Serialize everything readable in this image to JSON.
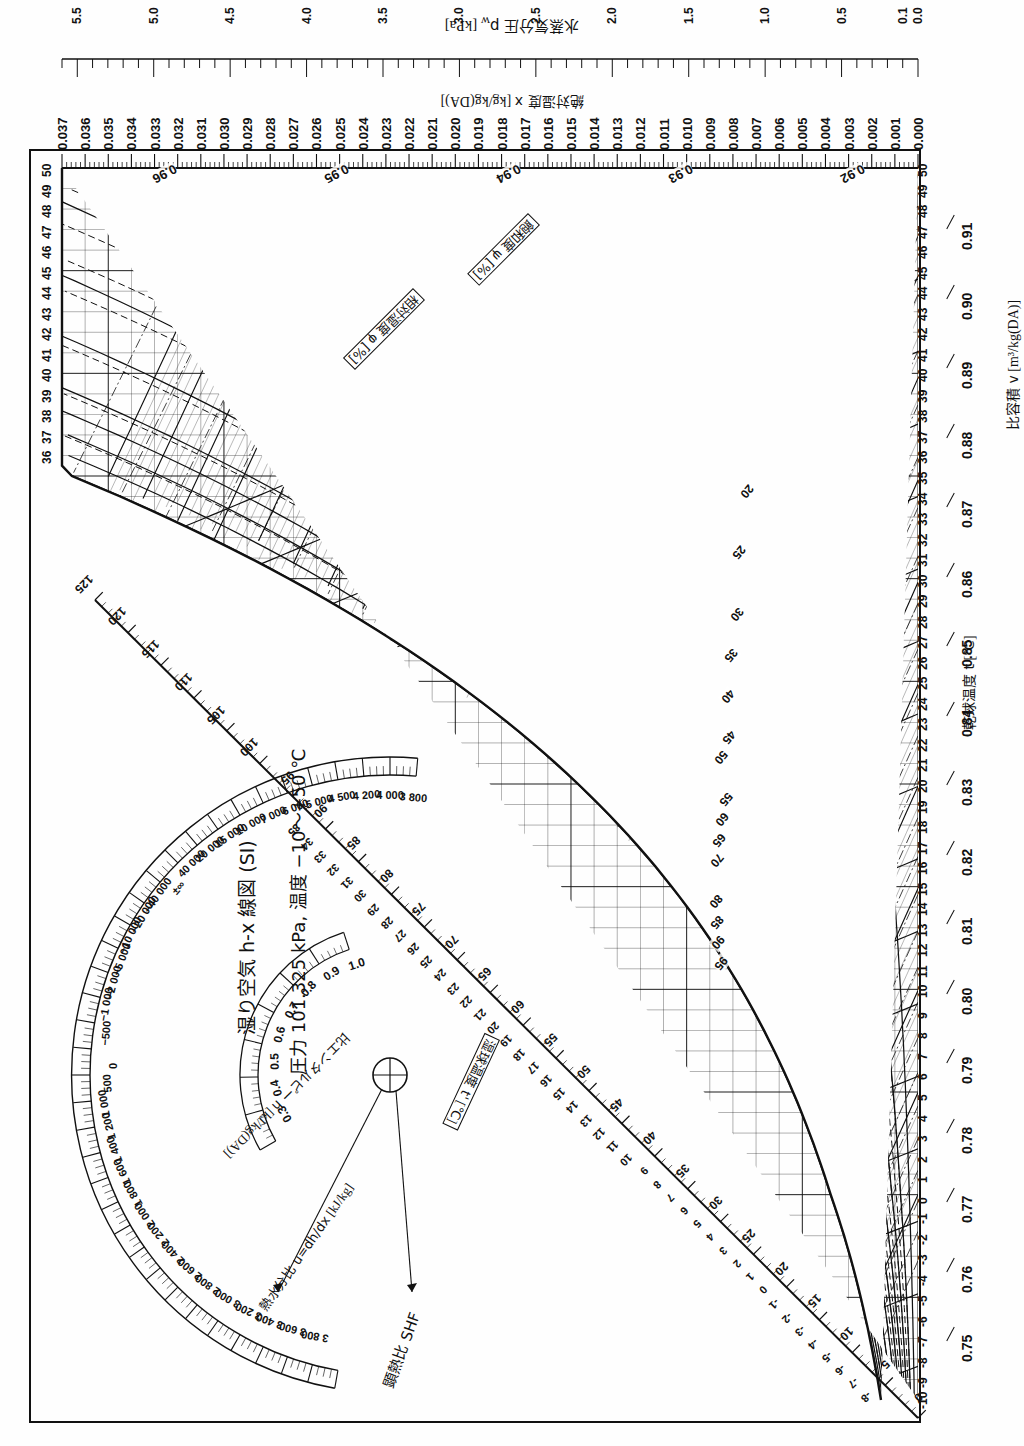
{
  "document": {
    "kind": "psychrometric-chart",
    "language": "ja",
    "title_line1": "湿り空気 h-x 線図 (SI)",
    "title_line2": "圧力 101.325 kPa,  温度 −10〜+50 ℃"
  },
  "axes": {
    "vapor_pressure": {
      "label": "水蒸気分圧 p",
      "label_sub": "w",
      "label_unit": "[kPa]",
      "ticks": [
        "5.5",
        "5.0",
        "4.5",
        "4.0",
        "3.5",
        "3.0",
        "2.5",
        "2.0",
        "1.5",
        "1.0",
        "0.5",
        "0.1",
        "0.0"
      ],
      "values": [
        5.5,
        5.0,
        4.5,
        4.0,
        3.5,
        3.0,
        2.5,
        2.0,
        1.5,
        1.0,
        0.5,
        0.1,
        0.0
      ],
      "minor_step": 0.1
    },
    "humidity_ratio": {
      "label": "絶対湿度 x",
      "label_unit": "[kg/kg(DA)]",
      "ticks": [
        "0.037",
        "0.036",
        "0.035",
        "0.034",
        "0.033",
        "0.032",
        "0.031",
        "0.030",
        "0.029",
        "0.028",
        "0.027",
        "0.026",
        "0.025",
        "0.024",
        "0.023",
        "0.022",
        "0.021",
        "0.020",
        "0.019",
        "0.018",
        "0.017",
        "0.016",
        "0.015",
        "0.014",
        "0.013",
        "0.012",
        "0.011",
        "0.010",
        "0.009",
        "0.008",
        "0.007",
        "0.006",
        "0.005",
        "0.004",
        "0.003",
        "0.002",
        "0.001",
        "0.000"
      ],
      "max": 0.037,
      "min": 0.0,
      "minor_step": 0.0002
    },
    "dry_bulb": {
      "label": "乾球温度 t",
      "label_unit": "[℃]",
      "min": -10,
      "max": 50,
      "ticks": [
        "-10",
        "-9",
        "-8",
        "-7",
        "-6",
        "-5",
        "-4",
        "-3",
        "-2",
        "-1",
        "0",
        "1",
        "2",
        "3",
        "4",
        "5",
        "6",
        "7",
        "8",
        "9",
        "10",
        "11",
        "12",
        "13",
        "14",
        "15",
        "16",
        "17",
        "18",
        "19",
        "20",
        "21",
        "22",
        "23",
        "24",
        "25",
        "26",
        "27",
        "28",
        "29",
        "30",
        "31",
        "32",
        "33",
        "34",
        "35",
        "36",
        "37",
        "38",
        "39",
        "40",
        "41",
        "42",
        "43",
        "44",
        "45",
        "46",
        "47",
        "48",
        "49",
        "50"
      ]
    },
    "specific_volume": {
      "label": "比容積 v",
      "label_unit": "[m³/kg(DA)]",
      "ticks": [
        "0.75",
        "0.76",
        "0.77",
        "0.78",
        "0.79",
        "0.80",
        "0.81",
        "0.82",
        "0.83",
        "0.84",
        "0.85",
        "0.86",
        "0.87",
        "0.88",
        "0.89",
        "0.90",
        "0.91"
      ],
      "values": [
        0.75,
        0.76,
        0.77,
        0.78,
        0.79,
        0.8,
        0.81,
        0.82,
        0.83,
        0.84,
        0.85,
        0.86,
        0.87,
        0.88,
        0.89,
        0.9,
        0.91
      ],
      "body_line_labels": [
        "0.92",
        "0.93",
        "0.94",
        "0.95",
        "0.96"
      ]
    },
    "enthalpy": {
      "label": "比エンタルピー h",
      "label_unit": "[kJ/kg(DA)]",
      "ticks": [
        "0",
        "5",
        "10",
        "15",
        "20",
        "25",
        "30",
        "35",
        "40",
        "45",
        "50",
        "55",
        "60",
        "65",
        "70",
        "75",
        "80",
        "85",
        "90",
        "95",
        "100",
        "105",
        "110",
        "115",
        "120",
        "125"
      ],
      "values": [
        0,
        5,
        10,
        15,
        20,
        25,
        30,
        35,
        40,
        45,
        50,
        55,
        60,
        65,
        70,
        75,
        80,
        85,
        90,
        95,
        100,
        105,
        110,
        115,
        120,
        125
      ],
      "minor_step": 1
    },
    "wet_bulb": {
      "label": "湿球温度 t'",
      "label_unit": "[℃]",
      "ticks": [
        "-8",
        "-7",
        "-6",
        "-5",
        "-4",
        "-3",
        "-2",
        "-1",
        "0",
        "1",
        "2",
        "3",
        "4",
        "5",
        "6",
        "7",
        "8",
        "9",
        "10",
        "11",
        "12",
        "13",
        "14",
        "15",
        "16",
        "17",
        "18",
        "19",
        "20",
        "21",
        "22",
        "23",
        "24",
        "25",
        "26",
        "27",
        "28",
        "29",
        "30",
        "31",
        "32",
        "33",
        "34",
        "35"
      ],
      "min": -8,
      "max": 35
    }
  },
  "curves": {
    "relative_humidity": {
      "label": "相対湿度 φ [%]",
      "symbol": "φ",
      "unit": "[%]",
      "values": [
        10,
        20,
        30,
        40,
        50,
        60,
        70,
        80,
        85,
        90,
        95,
        100
      ],
      "body_labels": [
        "20",
        "25",
        "30",
        "35",
        "40",
        "45",
        "50",
        "55",
        "60",
        "65",
        "70",
        "80",
        "85",
        "90",
        "95"
      ]
    },
    "saturation_degree": {
      "label": "飽和度 ψ [%]",
      "symbol": "ψ",
      "unit": "[%]",
      "values": [
        20,
        25,
        30,
        35,
        40,
        45,
        50,
        55,
        60,
        70,
        80,
        90
      ]
    }
  },
  "protractor": {
    "outer_scale": {
      "name": "熱水分比 u=dh/dx [kJ/kg]",
      "label": "熱水分比 u=dh/dx",
      "unit": "[kJ/kg]",
      "ticks": [
        "3 800",
        "3 600",
        "3 400",
        "3 200",
        "3 000",
        "2 800",
        "2 600",
        "2 400",
        "2 200",
        "2 000",
        "1 800",
        "1 600",
        "1 400",
        "1 200",
        "1 000",
        "500",
        "0",
        "−500",
        "−1 000",
        "−2 000",
        "−5 000",
        "−10 000",
        "−20 000",
        "−40 000",
        "±∞",
        "40 000",
        "20 000",
        "15 000",
        "10 000",
        "7 000",
        "6 000",
        "5 000",
        "4 500",
        "4 200",
        "4 000",
        "3 800"
      ],
      "values": [
        3800,
        3600,
        3400,
        3200,
        3000,
        2800,
        2600,
        2400,
        2200,
        2000,
        1800,
        1600,
        1400,
        1200,
        1000,
        500,
        0,
        -500,
        -1000,
        -2000,
        -5000,
        -10000,
        -20000,
        -40000,
        null,
        40000,
        20000,
        15000,
        10000,
        7000,
        6000,
        5000,
        4500,
        4200,
        4000,
        3800
      ]
    },
    "inner_scale": {
      "name": "顕熱比 SHF",
      "label": "顕熱比 SHF",
      "ticks": [
        "1.0",
        "0.9",
        "0.8",
        "0.7",
        "0.6",
        "0.5",
        "0.4",
        "0.3"
      ],
      "values": [
        1.0,
        0.9,
        0.8,
        0.7,
        0.6,
        0.5,
        0.4,
        0.3
      ]
    }
  },
  "style": {
    "ink": "#111111",
    "paper": "#fefefe",
    "grid_light": "#444444"
  }
}
